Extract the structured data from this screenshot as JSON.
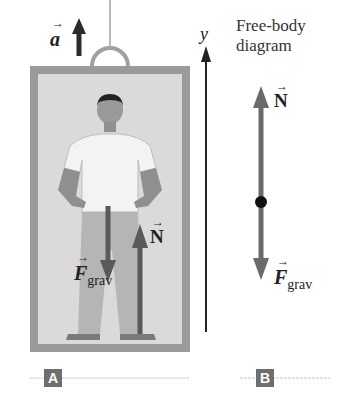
{
  "diagram": {
    "panel_a": {
      "tag": "A",
      "acceleration_label": "a",
      "axis_label": "y",
      "force_gravity_label": "F",
      "force_gravity_subscript": "grav",
      "normal_force_label": "N"
    },
    "panel_b": {
      "tag": "B",
      "title_line1": "Free-body",
      "title_line2": "diagram",
      "normal_force_label": "N",
      "force_gravity_label": "F",
      "force_gravity_subscript": "grav"
    },
    "colors": {
      "arrow_dark": "#2b2b2b",
      "arrow_gray": "#6a6a6a",
      "elevator_frame": "#9a9a9a",
      "elevator_interior": "#d9d9d9",
      "tag_bg": "#6e6e6e"
    }
  }
}
